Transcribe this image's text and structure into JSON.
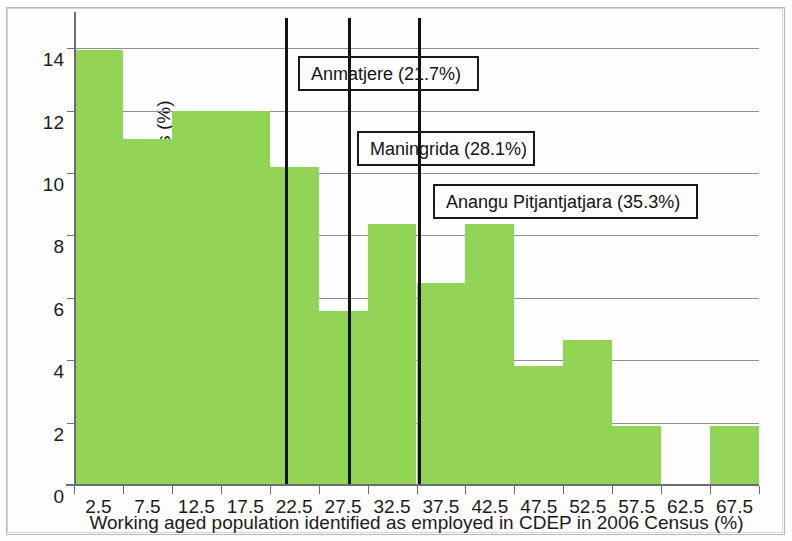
{
  "chart_data": {
    "type": "bar",
    "title": "",
    "subtitle": "",
    "xlabel": "Working aged population identified as employed in CDEP in 2006 Census (%)",
    "ylabel": "The proportion of remote IAREs (%)",
    "categories": [
      "2.5",
      "7.5",
      "12.5",
      "17.5",
      "22.5",
      "27.5",
      "32.5",
      "37.5",
      "42.5",
      "47.5",
      "52.5",
      "57.5",
      "62.5",
      "67.5"
    ],
    "bin_edges": [
      0,
      5,
      10,
      15,
      20,
      25,
      30,
      35,
      40,
      45,
      50,
      55,
      60,
      65,
      70
    ],
    "values": [
      13.95,
      11.1,
      12.0,
      12.0,
      10.2,
      5.57,
      8.35,
      6.48,
      8.35,
      3.82,
      4.65,
      1.9,
      0,
      1.9
    ],
    "bar_color": "#92d556",
    "xlim": [
      0,
      70
    ],
    "ylim": [
      0,
      15
    ],
    "yticks": [
      0,
      2,
      4,
      6,
      8,
      10,
      12,
      14
    ],
    "ytick_labels": [
      "0",
      "2",
      "4",
      "6",
      "8",
      "10",
      "12",
      "14"
    ],
    "xticks": [
      0,
      5,
      10,
      15,
      20,
      25,
      30,
      35,
      40,
      45,
      50,
      55,
      60,
      65,
      70
    ],
    "grid": "horizontal",
    "legend": "none",
    "annotations": [
      {
        "label": "Anmatjere (21.7%)",
        "value": 21.7,
        "box_left_px": 298,
        "box_top_px": 56,
        "box_width_px": 181,
        "box_height_px": 35
      },
      {
        "label": "Maningrida (28.1%)",
        "value": 28.1,
        "box_left_px": 357,
        "box_top_px": 131,
        "box_width_px": 178,
        "box_height_px": 35
      },
      {
        "label": "Anangu Pitjantjatjara (35.3%)",
        "value": 35.3,
        "box_left_px": 433,
        "box_top_px": 184,
        "box_width_px": 265,
        "box_height_px": 35
      }
    ]
  }
}
